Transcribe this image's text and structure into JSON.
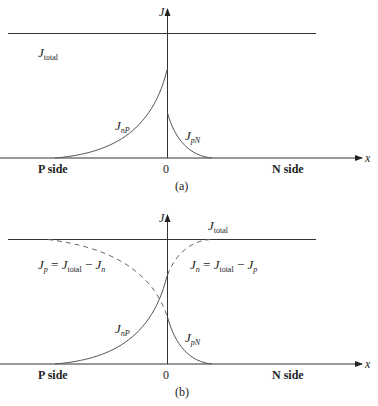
{
  "panel_a": {
    "y_axis_label": "J",
    "x_axis_label": "x",
    "total_label": "J",
    "total_sub": "total",
    "nP_label": "J",
    "nP_sub": "nP",
    "pN_label": "J",
    "pN_sub": "pN",
    "left_side": "P side",
    "right_side": "N side",
    "origin": "0",
    "caption": "(a)"
  },
  "panel_b": {
    "y_axis_label": "J",
    "x_axis_label": "x",
    "total_label": "J",
    "total_sub": "total",
    "jp_eq": {
      "lhs": "J",
      "lhs_sub": "p",
      "eq": " = ",
      "a": "J",
      "a_sub": "total",
      "minus": " − ",
      "b": "J",
      "b_sub": "n"
    },
    "jn_eq": {
      "lhs": "J",
      "lhs_sub": "n",
      "eq": " = ",
      "a": "J",
      "a_sub": "total",
      "minus": " − ",
      "b": "J",
      "b_sub": "p"
    },
    "nP_label": "J",
    "nP_sub": "nP",
    "pN_label": "J",
    "pN_sub": "pN",
    "left_side": "P side",
    "right_side": "N side",
    "origin": "0",
    "caption": "(b)"
  },
  "colors": {
    "line": "#333333",
    "curve": "#555555",
    "dashed": "#666666"
  }
}
